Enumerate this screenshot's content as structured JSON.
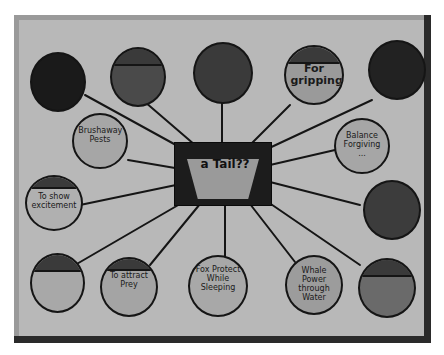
{
  "poster": {
    "type": "hand-drawn mind map on paper",
    "colors": {
      "board": "#b8b8b8",
      "ink": "#151515",
      "frame_shadow": "#2a2a2a"
    },
    "center": {
      "label": "a Tail??"
    },
    "nodes": [
      {
        "id": "top-left-dark",
        "text": "",
        "fill": "#1a1a1a"
      },
      {
        "id": "top-2",
        "text": "",
        "fill": "#4a4a4a"
      },
      {
        "id": "top-3",
        "text": "",
        "fill": "#3a3a3a"
      },
      {
        "id": "top-4",
        "text": "For gripping",
        "fill": "#9a9a9a"
      },
      {
        "id": "top-right-dark",
        "text": "",
        "fill": "#222222"
      },
      {
        "id": "left-1",
        "text": "Brushaway Pests",
        "fill": "#a6a6a6"
      },
      {
        "id": "right-1",
        "text": "Balance Forgiving ...",
        "fill": "#a6a6a6"
      },
      {
        "id": "left-2",
        "text": "To show excitement",
        "fill": "#b0b0b0"
      },
      {
        "id": "right-2",
        "text": "",
        "fill": "#3c3c3c"
      },
      {
        "id": "bottom-1",
        "text": "",
        "fill": "#a8a8a8"
      },
      {
        "id": "bottom-2",
        "text": "To attract Prey",
        "fill": "#a4a4a4"
      },
      {
        "id": "bottom-3",
        "text": "Fox Protect While Sleeping",
        "fill": "#a8a8a8"
      },
      {
        "id": "bottom-4",
        "text": "Whale Power through Water",
        "fill": "#9c9c9c"
      },
      {
        "id": "bottom-5",
        "text": "",
        "fill": "#6a6a6a"
      }
    ]
  }
}
